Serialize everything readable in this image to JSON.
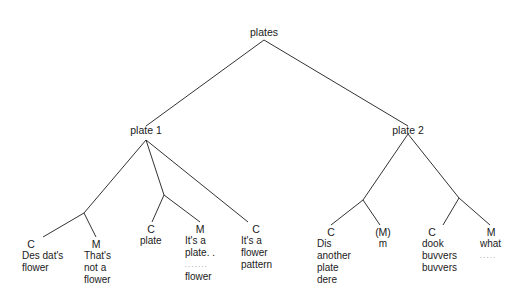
{
  "diagram": {
    "root": {
      "label": "plates"
    },
    "branches": [
      {
        "label": "plate 1",
        "leaves": [
          {
            "speaker": "C",
            "lines": [
              "Des dat's",
              "flower"
            ]
          },
          {
            "speaker": "M",
            "lines": [
              "That's",
              "not a",
              "flower"
            ]
          },
          {
            "speaker": "C",
            "lines": [
              "plate"
            ]
          },
          {
            "speaker": "M",
            "lines": [
              "It's a",
              "plate. .",
              ". . . . . . .",
              "flower"
            ]
          },
          {
            "speaker": "C",
            "lines": [
              "It's a",
              "flower",
              "pattern"
            ]
          }
        ]
      },
      {
        "label": "plate 2",
        "leaves": [
          {
            "speaker": "C",
            "lines": [
              "Dis",
              "another",
              "plate",
              "dere"
            ]
          },
          {
            "speaker": "(M)",
            "lines": [
              "m"
            ]
          },
          {
            "speaker": "C",
            "lines": [
              "dook",
              "buvvers",
              "buvvers"
            ]
          },
          {
            "speaker": "M",
            "lines": [
              "what",
              ". . . . ."
            ]
          }
        ]
      }
    ],
    "line_color": "#333333"
  }
}
